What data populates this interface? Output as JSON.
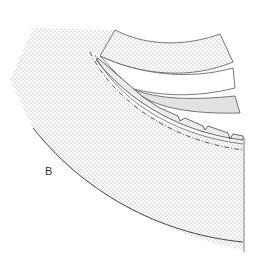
{
  "figure": {
    "type": "anatomical cross-section diagram",
    "labels": {
      "region_b": "B"
    },
    "colors": {
      "stipple_dot": "#8a8a8a",
      "outline": "#444444",
      "grey_band_fill": "#e2e2e2",
      "background": "#ffffff"
    },
    "layers": [
      {
        "name": "main stippled body",
        "fill": "stippled"
      },
      {
        "name": "upper stippled band",
        "fill": "stippled"
      },
      {
        "name": "middle white band",
        "fill": "white"
      },
      {
        "name": "lower grey band",
        "fill": "grey"
      },
      {
        "name": "serrated membrane layer",
        "fill": "light grey"
      }
    ]
  }
}
